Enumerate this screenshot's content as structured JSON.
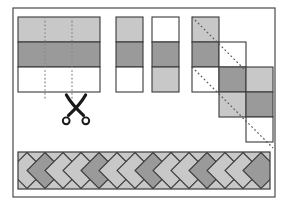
{
  "figure": {
    "caption": "",
    "frame": {
      "x": 13,
      "y": 8,
      "width": 262,
      "height": 189,
      "stroke": "#4a4a4a",
      "stroke_width": 1.2,
      "fill": "#ffffff"
    }
  },
  "palette": {
    "light": "#c8c8c8",
    "dark": "#9a9a9a",
    "white": "#ffffff",
    "outline": "#3a3a3a",
    "frame_stroke": "#4a4a4a",
    "cut_line": "#8a8a8a",
    "diagonal_line": "#5a5a5a",
    "scissors": "#1a1a1a",
    "background": "#ffffff"
  },
  "panel_strip_set": {
    "label": "pieced strip set with cutting lines",
    "x": 18,
    "y": 17,
    "width": 82,
    "height": 75,
    "bands": [
      {
        "name": "band-top",
        "shade": "light",
        "height": 25
      },
      {
        "name": "band-middle",
        "shade": "dark",
        "height": 25
      },
      {
        "name": "band-bottom",
        "shade": "white",
        "height": 25
      }
    ],
    "cut_lines": [
      {
        "name": "cut-line-1",
        "x": 45
      },
      {
        "name": "cut-line-2",
        "x": 72
      }
    ]
  },
  "scissors": {
    "label": "scissors",
    "x": 64,
    "y": 95,
    "width": 24,
    "height": 30
  },
  "panel_cut_strips": {
    "label": "two cut strip segments",
    "strips": [
      {
        "name": "cut-strip-a",
        "x": 116,
        "y": 17,
        "width": 27,
        "height": 75,
        "cells": [
          {
            "shade": "light"
          },
          {
            "shade": "dark"
          },
          {
            "shade": "white"
          }
        ]
      },
      {
        "name": "cut-strip-b",
        "x": 152,
        "y": 17,
        "width": 27,
        "height": 75,
        "cells": [
          {
            "shade": "white"
          },
          {
            "shade": "dark"
          },
          {
            "shade": "light"
          }
        ]
      }
    ]
  },
  "panel_offset_strips": {
    "label": "strips offset diagonally with cutting guides",
    "strips": [
      {
        "name": "offset-strip-1",
        "x": 192,
        "y": 17,
        "width": 27,
        "height": 75,
        "cells": [
          {
            "shade": "light"
          },
          {
            "shade": "dark"
          },
          {
            "shade": "white"
          }
        ]
      },
      {
        "name": "offset-strip-2",
        "x": 219,
        "y": 42,
        "width": 27,
        "height": 75,
        "cells": [
          {
            "shade": "white"
          },
          {
            "shade": "dark"
          },
          {
            "shade": "light"
          }
        ]
      },
      {
        "name": "offset-strip-3",
        "x": 246,
        "y": 67,
        "width": 27,
        "height": 75,
        "cells": [
          {
            "shade": "light"
          },
          {
            "shade": "dark"
          },
          {
            "shade": "white"
          }
        ]
      }
    ],
    "diagonal_lines": [
      {
        "name": "diagonal-guide-1",
        "x1": 192,
        "y1": 17,
        "x2": 246,
        "y2": 71
      },
      {
        "name": "diagonal-guide-2",
        "x1": 192,
        "y1": 67,
        "x2": 273,
        "y2": 148
      }
    ]
  },
  "panel_diamond_band": {
    "label": "finished on-point diamond border",
    "x": 18,
    "y": 152,
    "width": 252,
    "height": 37,
    "diamond_size": 18,
    "shades": [
      "light",
      "dark",
      "light",
      "light",
      "dark",
      "light",
      "light",
      "dark",
      "light",
      "light",
      "dark",
      "light",
      "light",
      "dark"
    ],
    "corner_fill": "light"
  }
}
